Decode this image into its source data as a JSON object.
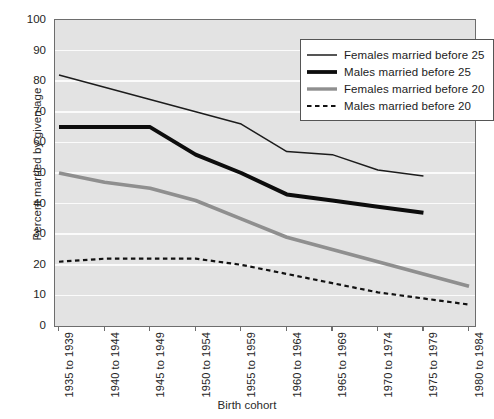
{
  "chart_data": {
    "type": "line",
    "title": "",
    "xlabel": "Birth cohort",
    "ylabel": "Percent married by given age",
    "ylim": [
      0,
      100
    ],
    "ytick_step": 10,
    "yticks": [
      "0",
      "10",
      "20",
      "30",
      "40",
      "50",
      "60",
      "70",
      "80",
      "90",
      "100"
    ],
    "grid": "horizontal-white",
    "legend_position": "top-right-inside",
    "plot_background": "#e3e3e3",
    "categories": [
      "1935 to 1939",
      "1940 to 1944",
      "1945 to 1949",
      "1950 to 1954",
      "1955 to 1959",
      "1960 to 1964",
      "1965 to 1969",
      "1970 to 1974",
      "1975 to 1979",
      "1980 to 1984"
    ],
    "series": [
      {
        "name": "Females married before 25",
        "style": "thin-solid",
        "color": "#1c1c1c",
        "width": 1.5,
        "values": [
          82,
          78,
          74,
          70,
          66,
          57,
          56,
          51,
          49,
          null
        ]
      },
      {
        "name": "Males married before 25",
        "style": "thick-solid",
        "color": "#0d0d0d",
        "width": 4.0,
        "values": [
          65,
          65,
          65,
          56,
          50,
          43,
          41,
          39,
          37,
          null
        ]
      },
      {
        "name": "Females married before 20",
        "style": "thick-gray-solid",
        "color": "#8f8f8f",
        "width": 3.6,
        "values": [
          50,
          47,
          45,
          41,
          35,
          29,
          25,
          21,
          17,
          13
        ]
      },
      {
        "name": "Males married before 20",
        "style": "dashed",
        "color": "#121212",
        "width": 2.2,
        "values": [
          21,
          22,
          22,
          22,
          20,
          17,
          14,
          11,
          9,
          7
        ]
      }
    ]
  }
}
